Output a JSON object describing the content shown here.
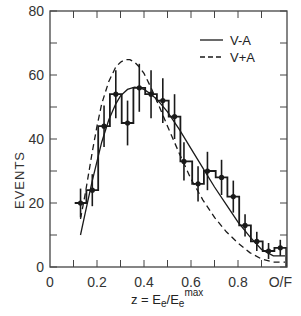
{
  "chart_data": {
    "type": "line",
    "title": "",
    "xlabel": "z = E_e / E_e^max",
    "xlabel_parts": {
      "prefix": "z = E",
      "sub1": "e",
      "slash": "/E",
      "sub2": "e",
      "sup": "max"
    },
    "ylabel": "EVENTS",
    "xlim": [
      0,
      1.01
    ],
    "ylim": [
      0,
      80
    ],
    "x_ticks": [
      "0",
      "0.2",
      "0.4",
      "0.6",
      "0.8",
      "O/F"
    ],
    "x_tick_values": [
      0,
      0.2,
      0.4,
      0.6,
      0.8,
      0.98
    ],
    "y_ticks": [
      "0",
      "20",
      "40",
      "60",
      "80"
    ],
    "y_tick_values": [
      0,
      20,
      40,
      60,
      80
    ],
    "grid": false,
    "legend_position": "upper right",
    "legend": [
      {
        "label": "V-A",
        "style": "solid"
      },
      {
        "label": "V+A",
        "style": "dashed"
      }
    ],
    "series": [
      {
        "name": "data",
        "kind": "histogram-with-errorbars",
        "x": [
          0.13,
          0.18,
          0.23,
          0.28,
          0.33,
          0.38,
          0.43,
          0.48,
          0.53,
          0.57,
          0.63,
          0.67,
          0.73,
          0.78,
          0.83,
          0.88,
          0.93,
          0.98
        ],
        "values": [
          20,
          24,
          44,
          54,
          45,
          56,
          54,
          52,
          47,
          33,
          26,
          30,
          28,
          22,
          13,
          8,
          5,
          6
        ],
        "errors": [
          4.5,
          5,
          6.5,
          7.5,
          7,
          7.5,
          7.5,
          7,
          7,
          6,
          5.5,
          6,
          5.5,
          5,
          3.5,
          3,
          2.5,
          2.5
        ],
        "bin_edges": [
          0.105,
          0.155,
          0.205,
          0.255,
          0.305,
          0.355,
          0.405,
          0.455,
          0.505,
          0.555,
          0.605,
          0.655,
          0.705,
          0.755,
          0.805,
          0.855,
          0.905,
          0.955,
          1.005
        ]
      },
      {
        "name": "V-A",
        "style": "solid",
        "x": [
          0.13,
          0.15,
          0.18,
          0.2,
          0.22,
          0.25,
          0.28,
          0.3,
          0.33,
          0.36,
          0.38,
          0.4,
          0.43,
          0.46,
          0.5,
          0.55,
          0.6,
          0.65,
          0.7,
          0.75,
          0.8,
          0.85,
          0.9,
          0.95,
          1.0
        ],
        "values": [
          10,
          17,
          27,
          33,
          39,
          46,
          51,
          53.5,
          55.5,
          56.2,
          56,
          55.5,
          54,
          52,
          48.5,
          43,
          37,
          31,
          25,
          19.5,
          14,
          9.5,
          5.5,
          3.5,
          3.5
        ]
      },
      {
        "name": "V+A",
        "style": "dashed",
        "x": [
          0.13,
          0.15,
          0.18,
          0.2,
          0.22,
          0.25,
          0.28,
          0.3,
          0.32,
          0.34,
          0.36,
          0.38,
          0.4,
          0.43,
          0.46,
          0.5,
          0.55,
          0.6,
          0.65,
          0.7,
          0.75,
          0.8,
          0.85,
          0.9,
          0.95,
          1.0
        ],
        "values": [
          15,
          23,
          36,
          44,
          51,
          58,
          62.5,
          64,
          64.8,
          64.8,
          64,
          62.5,
          60.5,
          56,
          51,
          44,
          35.5,
          27.5,
          21,
          15.5,
          11,
          7.5,
          4.5,
          2.5,
          1.5,
          1.5
        ]
      }
    ]
  },
  "axes": {
    "ylabel": "EVENTS",
    "x_ticks": [
      "0",
      "0.2",
      "0.4",
      "0.6",
      "0.8",
      "O/F"
    ],
    "y_ticks": [
      "0",
      "20",
      "40",
      "60",
      "80"
    ]
  },
  "legend": {
    "items": [
      {
        "label": "V-A",
        "style": "solid"
      },
      {
        "label": "V+A",
        "style": "dashed"
      }
    ]
  },
  "colors": {
    "ink": "#1a1a1a",
    "axis": "#444444",
    "background": "#ffffff"
  }
}
